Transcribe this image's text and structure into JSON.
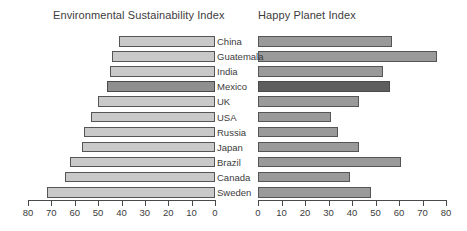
{
  "chart_data": {
    "type": "bar",
    "orientation": "horizontal",
    "layout": "paired-diverging-panels",
    "categories": [
      "China",
      "Guatemala",
      "India",
      "Mexico",
      "UK",
      "USA",
      "Russia",
      "Japan",
      "Brazil",
      "Canada",
      "Sweden"
    ],
    "panels": [
      {
        "title": "Environmental Sustainability Index",
        "position": "left",
        "direction": "right-to-left",
        "values": [
          41,
          44,
          45,
          46,
          50,
          53,
          56,
          57,
          62,
          64,
          72
        ],
        "xlim": [
          80,
          0
        ],
        "ticks": [
          80,
          70,
          60,
          50,
          40,
          30,
          20,
          10,
          0
        ],
        "ticklabels": [
          "80",
          "70",
          "60",
          "50",
          "40",
          "30",
          "20",
          "10",
          "0"
        ],
        "xlabel": "",
        "ylabel": "",
        "grid": false,
        "bar_color": "#c9c9c9",
        "highlight_color": "#8f8f8f",
        "highlight_categories": [
          "Mexico"
        ]
      },
      {
        "title": "Happy Planet Index",
        "position": "right",
        "direction": "left-to-right",
        "values": [
          57,
          76,
          53,
          56,
          43,
          31,
          34,
          43,
          61,
          39,
          48
        ],
        "xlim": [
          0,
          80
        ],
        "ticks": [
          0,
          10,
          20,
          30,
          40,
          50,
          60,
          70,
          80
        ],
        "ticklabels": [
          "0",
          "10",
          "20",
          "30",
          "40",
          "50",
          "60",
          "70",
          "80"
        ],
        "xlabel": "",
        "ylabel": "",
        "grid": false,
        "bar_color": "#9a9a9a",
        "highlight_color": "#5e5e5e",
        "highlight_categories": [
          "Mexico"
        ]
      }
    ],
    "title": "",
    "legend": null
  }
}
